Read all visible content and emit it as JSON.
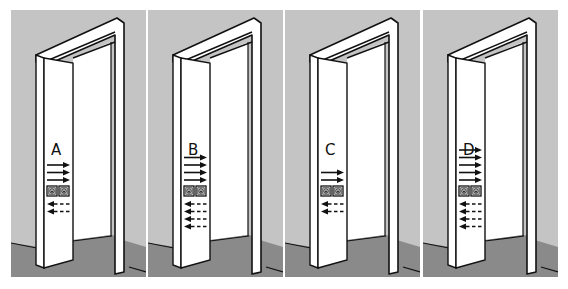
{
  "figure": {
    "colors": {
      "wall": "#c4c4c4",
      "floor": "#8a8a8a",
      "frame": "#ffffff",
      "line": "#111111"
    },
    "panels": [
      {
        "label": "A",
        "solid_arrows": 3,
        "dashed_arrows": 2,
        "x": 11
      },
      {
        "label": "B",
        "solid_arrows": 4,
        "dashed_arrows": 4,
        "x": 148
      },
      {
        "label": "C",
        "solid_arrows": 2,
        "dashed_arrows": 2,
        "x": 285
      },
      {
        "label": "D",
        "solid_arrows": 5,
        "dashed_arrows": 4,
        "x": 423
      }
    ],
    "icons": [
      "symbol-square-left-icon",
      "symbol-square-right-icon"
    ]
  }
}
